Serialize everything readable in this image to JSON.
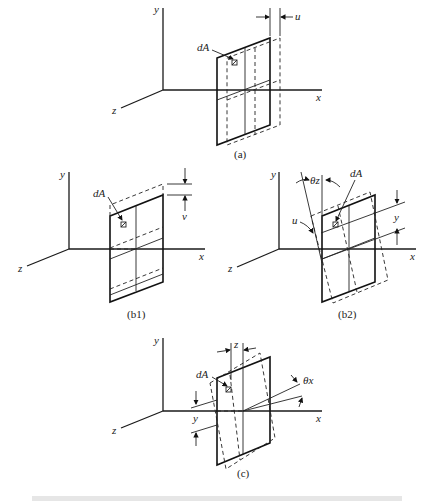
{
  "figure": {
    "panels": [
      {
        "id": "a",
        "caption": "(a)",
        "labels": {
          "y": "y",
          "x": "x",
          "z": "z",
          "element": "dA",
          "displacement": "u"
        }
      },
      {
        "id": "b1",
        "caption": "(b1)",
        "labels": {
          "y": "y",
          "x": "x",
          "z": "z",
          "element": "dA",
          "displacement": "v"
        }
      },
      {
        "id": "b2",
        "caption": "(b2)",
        "labels": {
          "y": "y",
          "x": "x",
          "z": "z",
          "element": "dA",
          "angle": "θz",
          "displacement": "u",
          "distance": "y"
        }
      },
      {
        "id": "c",
        "caption": "(c)",
        "labels": {
          "y": "y",
          "x": "x",
          "z": "z",
          "element": "dA",
          "angle": "θx",
          "distance_z": "z",
          "distance_y": "y"
        }
      }
    ],
    "bottom_caption_partial": "Figure (cropped, illegible)"
  }
}
